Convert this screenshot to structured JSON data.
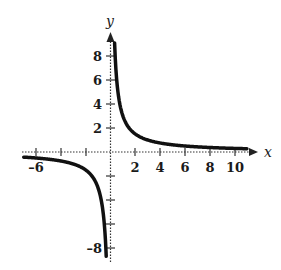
{
  "chart_data": {
    "type": "line",
    "title": "",
    "function": "y = 3/x",
    "xlabel": "x",
    "ylabel": "y",
    "xlim": [
      -7,
      11.5
    ],
    "ylim": [
      -9,
      9.5
    ],
    "grid": false,
    "x_ticks": [
      -6,
      -4,
      -2,
      2,
      4,
      6,
      8,
      10
    ],
    "x_tick_labels": [
      "–6",
      "2",
      "4",
      "6",
      "8",
      "10"
    ],
    "y_ticks": [
      -8,
      -6,
      -4,
      -2,
      2,
      4,
      6,
      8
    ],
    "y_tick_labels": [
      "8",
      "6",
      "4",
      "2",
      "–8"
    ],
    "series": [
      {
        "name": "left branch",
        "x": [
          -7,
          -6,
          -5,
          -4,
          -3,
          -2,
          -1.5,
          -1,
          -0.75,
          -0.5,
          -0.375
        ],
        "y": [
          -0.43,
          -0.5,
          -0.6,
          -0.75,
          -1,
          -1.5,
          -2,
          -3,
          -4,
          -6,
          -8
        ]
      },
      {
        "name": "right branch",
        "x": [
          0.33,
          0.5,
          0.75,
          1,
          1.5,
          2,
          3,
          4,
          6,
          8,
          10,
          11
        ],
        "y": [
          9,
          6,
          4,
          3,
          2,
          1.5,
          1,
          0.75,
          0.5,
          0.375,
          0.3,
          0.27
        ]
      }
    ]
  },
  "labels": {
    "x_axis": "x",
    "y_axis": "y",
    "tick_neg6": "–6",
    "tick_2": "2",
    "tick_4": "4",
    "tick_6": "6",
    "tick_8": "8",
    "tick_10": "10",
    "ytick_8": "8",
    "ytick_6": "6",
    "ytick_4": "4",
    "ytick_2": "2",
    "ytick_neg8": "–8"
  }
}
